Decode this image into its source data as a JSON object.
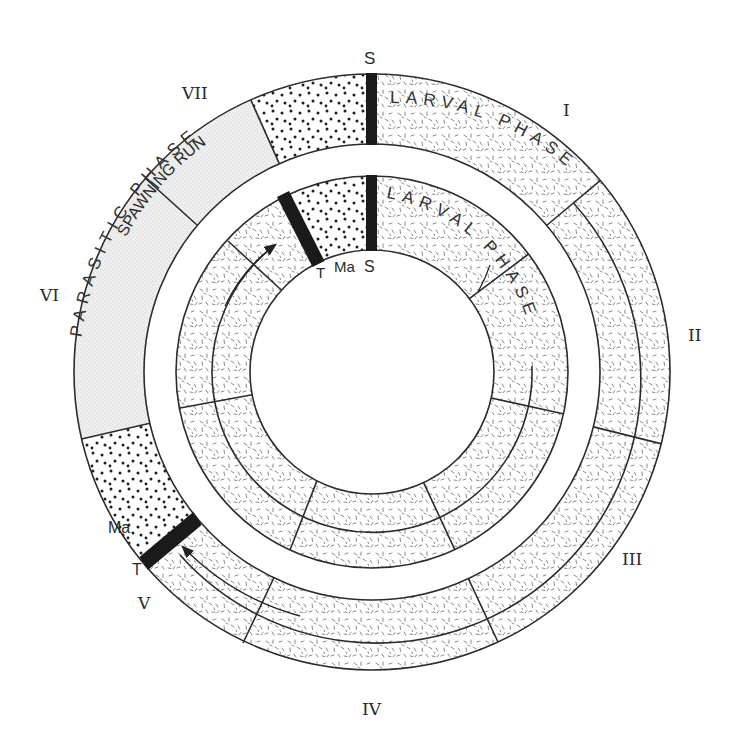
{
  "diagram": {
    "center": {
      "x": 372,
      "y": 372
    },
    "outer_ring": {
      "labels": {
        "spawning_run": "SPAWNING RUN",
        "larval_phase": "LARVAL PHASE",
        "parasitic_phase": "PARASITIC PHASE"
      },
      "markers": {
        "spawning": "S",
        "metamorphosis": "Ma",
        "transformation": "T"
      }
    },
    "inner_ring": {
      "labels": {
        "larval_phase": "LARVAL PHASE"
      },
      "markers": {
        "spawning": "S",
        "metamorphosis": "Ma",
        "transformation": "T"
      }
    },
    "season_labels": [
      "I",
      "II",
      "III",
      "IV",
      "V",
      "VI",
      "VII"
    ],
    "textures": {
      "spawning": "dots",
      "larval": "dashes",
      "parasitic": "fine-stipple"
    },
    "colors": {
      "ink": "#2b2b2b",
      "bar": "#1a1a1a",
      "parasitic_fill": "#ececec",
      "background": "#ffffff"
    }
  }
}
